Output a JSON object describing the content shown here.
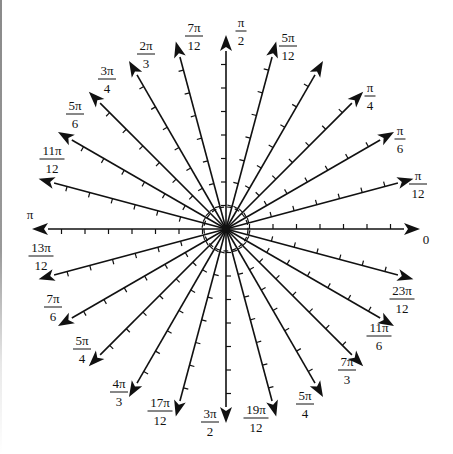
{
  "diagram": {
    "title": "",
    "type": "polar-angle-rays",
    "center": {
      "x": 226,
      "y": 229
    },
    "ray_length": 194,
    "tick_spacing": 23.5,
    "ticks_per_ray": 7,
    "inner_circle_radius": 22,
    "colors": {
      "stroke": "#111111",
      "background": "#ffffff",
      "edge_line": "#8a8a8a"
    },
    "rays": [
      {
        "angle_deg": 0,
        "label": "0",
        "num": "0",
        "den": "",
        "lx": 426,
        "ly": 244
      },
      {
        "angle_deg": 15,
        "label": "π/12",
        "num": "π",
        "den": "12",
        "lx": 418,
        "ly": 180
      },
      {
        "angle_deg": 30,
        "label": "π/6",
        "num": "π",
        "den": "6",
        "lx": 400,
        "ly": 135
      },
      {
        "angle_deg": 45,
        "label": "π/4",
        "num": "π",
        "den": "4",
        "lx": 370,
        "ly": 92
      },
      {
        "angle_deg": 60,
        "label": "",
        "num": "",
        "den": "",
        "lx": 0,
        "ly": 0
      },
      {
        "angle_deg": 75,
        "label": "5π/12",
        "num": "5π",
        "den": "12",
        "lx": 288,
        "ly": 42
      },
      {
        "angle_deg": 90,
        "label": "π/2",
        "num": "π",
        "den": "2",
        "lx": 241,
        "ly": 27
      },
      {
        "angle_deg": 105,
        "label": "7π/12",
        "num": "7π",
        "den": "12",
        "lx": 194,
        "ly": 32
      },
      {
        "angle_deg": 120,
        "label": "2π/3",
        "num": "2π",
        "den": "3",
        "lx": 146,
        "ly": 50
      },
      {
        "angle_deg": 135,
        "label": "3π/4",
        "num": "3π",
        "den": "4",
        "lx": 107,
        "ly": 75
      },
      {
        "angle_deg": 150,
        "label": "5π/6",
        "num": "5π",
        "den": "6",
        "lx": 75,
        "ly": 110
      },
      {
        "angle_deg": 165,
        "label": "11π/12",
        "num": "11π",
        "den": "12",
        "lx": 52,
        "ly": 155
      },
      {
        "angle_deg": 180,
        "label": "π",
        "num": "π",
        "den": "",
        "lx": 30,
        "ly": 219
      },
      {
        "angle_deg": 195,
        "label": "13π/12",
        "num": "13π",
        "den": "12",
        "lx": 41,
        "ly": 252
      },
      {
        "angle_deg": 210,
        "label": "7π/6",
        "num": "7π",
        "den": "6",
        "lx": 53,
        "ly": 303
      },
      {
        "angle_deg": 225,
        "label": "5π/4",
        "num": "5π",
        "den": "4",
        "lx": 82,
        "ly": 345
      },
      {
        "angle_deg": 240,
        "label": "4π/3",
        "num": "4π",
        "den": "3",
        "lx": 119,
        "ly": 388
      },
      {
        "angle_deg": 255,
        "label": "17π/12",
        "num": "17π",
        "den": "12",
        "lx": 160,
        "ly": 407
      },
      {
        "angle_deg": 270,
        "label": "3π/2",
        "num": "3π",
        "den": "2",
        "lx": 210,
        "ly": 418
      },
      {
        "angle_deg": 285,
        "label": "19π/12",
        "num": "19π",
        "den": "12",
        "lx": 256,
        "ly": 414
      },
      {
        "angle_deg": 300,
        "label": "5π/4",
        "num": "5π",
        "den": "4",
        "lx": 305,
        "ly": 400
      },
      {
        "angle_deg": 315,
        "label": "7π/3",
        "num": "7π",
        "den": "3",
        "lx": 347,
        "ly": 366
      },
      {
        "angle_deg": 330,
        "label": "11π/6",
        "num": "11π",
        "den": "6",
        "lx": 379,
        "ly": 332
      },
      {
        "angle_deg": 345,
        "label": "23π/12",
        "num": "23π",
        "den": "12",
        "lx": 402,
        "ly": 295
      }
    ]
  }
}
